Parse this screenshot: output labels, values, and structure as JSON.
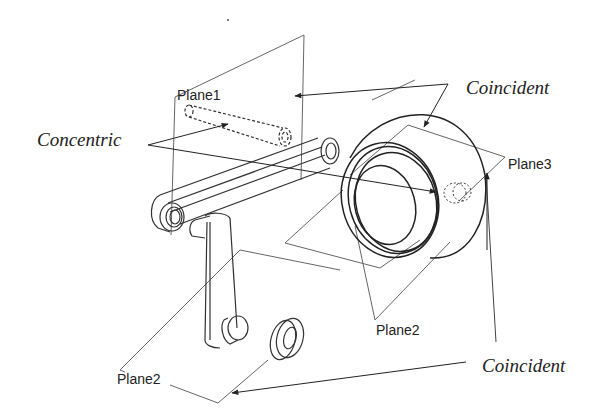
{
  "diagram": {
    "type": "assembly-mate-constraints",
    "labels": {
      "plane1": "Plane1",
      "plane2_right": "Plane2",
      "plane2_left": "Plane2",
      "plane3": "Plane3",
      "concentric": "Concentric",
      "coincident_top": "Coincident",
      "coincident_bottom": "Coincident"
    },
    "parts": [
      "connecting-rod",
      "crank",
      "piston",
      "washer",
      "piston-pin"
    ],
    "colors": {
      "line": "#333333",
      "plane_line": "#666666",
      "text": "#222222",
      "background": "#ffffff"
    }
  }
}
